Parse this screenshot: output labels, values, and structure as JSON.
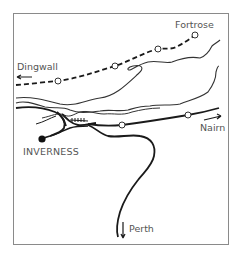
{
  "map": {
    "labels": {
      "fortrose": "Fortrose",
      "dingwall": "Dingwall",
      "nairn": "Nairn",
      "inverness": "INVERNESS",
      "perth": "Perth"
    },
    "colors": {
      "line": "#1a1a1a",
      "coast": "#333333",
      "label": "#555555",
      "frame": "#8a8a8a"
    },
    "stations": {
      "fortrose_line": [
        "Fortrose terminus",
        "intermediate 1",
        "intermediate 2",
        "intermediate 3"
      ],
      "nairn_line": [
        "intermediate 1",
        "intermediate 2"
      ]
    },
    "directions": {
      "dingwall": "west",
      "nairn": "east",
      "perth": "south"
    }
  }
}
